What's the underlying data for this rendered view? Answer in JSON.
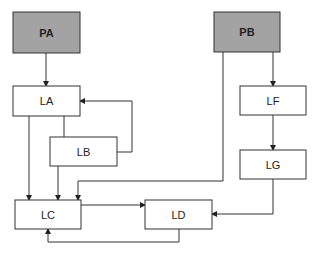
{
  "diagram": {
    "nodes": {
      "pa": {
        "label": "PA",
        "fill": "#a3a3a3"
      },
      "pb": {
        "label": "PB",
        "fill": "#a3a3a3"
      },
      "la": {
        "label": "LA",
        "fill": "#ffffff"
      },
      "lb": {
        "label": "LB",
        "fill": "#ffffff"
      },
      "lc": {
        "label": "LC",
        "fill": "#ffffff"
      },
      "ld": {
        "label": "LD",
        "fill": "#ffffff"
      },
      "lf": {
        "label": "LF",
        "fill": "#ffffff"
      },
      "lg": {
        "label": "LG",
        "fill": "#ffffff"
      }
    },
    "edges": [
      {
        "from": "PA",
        "to": "LA"
      },
      {
        "from": "LA",
        "to": "LB"
      },
      {
        "from": "LB",
        "to": "LA"
      },
      {
        "from": "LA",
        "to": "LC"
      },
      {
        "from": "LB",
        "to": "LC"
      },
      {
        "from": "PB",
        "to": "LC"
      },
      {
        "from": "PB",
        "to": "LF"
      },
      {
        "from": "LF",
        "to": "LG"
      },
      {
        "from": "LG",
        "to": "LD"
      },
      {
        "from": "LC",
        "to": "LD"
      },
      {
        "from": "LD",
        "to": "LC"
      }
    ],
    "colors": {
      "stroke": "#333333",
      "shaded": "#a3a3a3",
      "plain": "#ffffff"
    }
  }
}
